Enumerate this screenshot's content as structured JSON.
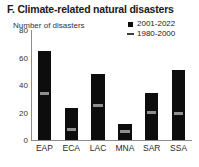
{
  "chart_data": {
    "type": "bar",
    "title": "F. Climate-related natural disasters",
    "ylabel": "Number of disasters",
    "xlabel": "",
    "categories": [
      "EAP",
      "ECA",
      "LAC",
      "MNA",
      "SAR",
      "SSA"
    ],
    "ylim": [
      0,
      80
    ],
    "yticks": [
      0,
      20,
      40,
      60,
      80
    ],
    "ytick_labels": [
      "0",
      "20",
      "40",
      "60",
      "80"
    ],
    "grid": false,
    "legend_position": "top-right",
    "series": [
      {
        "name": "2001-2022",
        "marker": "filled-square",
        "color": "#0d0d0d",
        "render": "bar",
        "values": [
          65,
          23,
          48,
          12,
          34,
          51
        ]
      },
      {
        "name": "1980-2000",
        "marker": "dash",
        "color": "#8f8f8f",
        "render": "dash-overlay",
        "values": [
          34,
          8,
          25,
          6,
          20,
          19
        ]
      }
    ]
  },
  "legend": {
    "items": [
      {
        "label": "2001-2022",
        "marker": "square"
      },
      {
        "label": "1980-2000",
        "marker": "dash"
      }
    ]
  }
}
